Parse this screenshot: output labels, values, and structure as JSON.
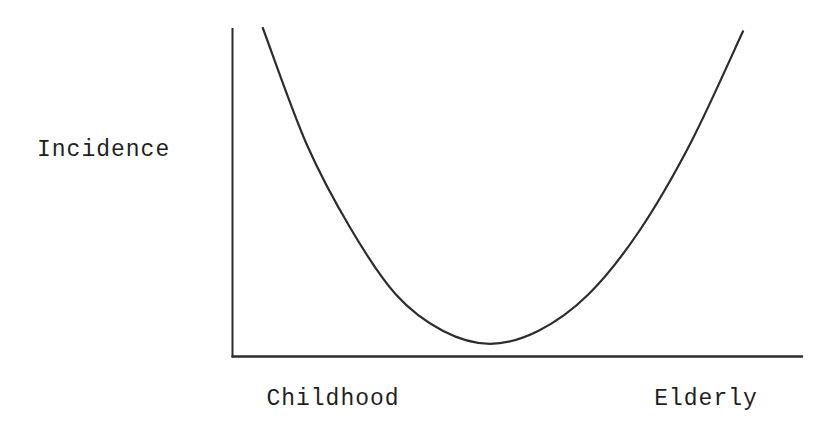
{
  "figure": {
    "background": "#ffffff",
    "line_color": "#2d2d2d",
    "text_color": "#1f1f1f"
  },
  "labels": {
    "y_axis": "Incidence",
    "x_tick_left": "Childhood",
    "x_tick_right": "Elderly"
  },
  "chart_data": {
    "type": "line",
    "title": "",
    "xlabel": "",
    "ylabel": "Incidence",
    "x_tick_labels": [
      "Childhood",
      "Elderly"
    ],
    "x_tick_positions_fraction": [
      0.18,
      0.83
    ],
    "axis_ranges": {
      "x_fraction": [
        0,
        1
      ],
      "y_fraction": [
        0,
        1
      ]
    },
    "grid": false,
    "numeric_ticks_visible": false,
    "legend": null,
    "series": [
      {
        "name": "incidence-vs-age",
        "x_fraction": [
          0.054,
          0.13,
          0.208,
          0.287,
          0.369,
          0.452,
          0.537,
          0.624,
          0.712,
          0.803,
          0.895
        ],
        "y_fraction": [
          1.0,
          0.65,
          0.39,
          0.19,
          0.08,
          0.04,
          0.08,
          0.19,
          0.38,
          0.65,
          0.99
        ]
      }
    ]
  }
}
